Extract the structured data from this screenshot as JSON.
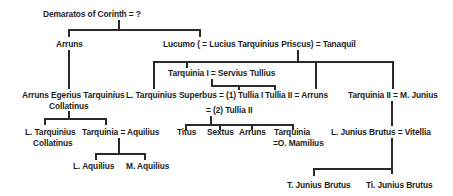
{
  "diagram": {
    "nodes": {
      "demaratos": "Demaratos of Corinth = ?",
      "arruns_1": "Arruns",
      "lucumo": "Lucumo ( = Lucius Tarquinius Priscus) = Tanaquil",
      "arruns_egerius_1": "Arruns Egerius Tarquinius",
      "arruns_egerius_2": "Collatinus",
      "tarquinia_1": "Tarquinia I  =  Servius Tullius",
      "superbus": "L. Tarquinius Superbus =  (1) Tullia I",
      "superbus_2": "=  (2) Tullia II",
      "tullia_2": "Tullia II  =  Arruns",
      "tarquinia_2": "Tarquinia II  =  M. Junius",
      "l_collatinus_1": "L. Tarquinius",
      "l_collatinus_2": "Collatinus",
      "tarquinia_aquilius": "Tarquinia = Aquilius",
      "titus": "Titus",
      "sextus": "Sextus",
      "arruns_3": "Arruns",
      "tarquinia_mam_1": "Tarquinia",
      "tarquinia_mam_2": "=O. Mamilius",
      "brutus": "L. Junius Brutus  =  Vitellia",
      "l_aquilius": "L. Aquilius",
      "m_aquilius": "M. Aquilius",
      "t_brutus": "T. Junius Brutus",
      "ti_brutus": "Ti. Junius Brutus"
    },
    "line_color": "#2a2a2a",
    "text_color": "#1e1e1e"
  }
}
